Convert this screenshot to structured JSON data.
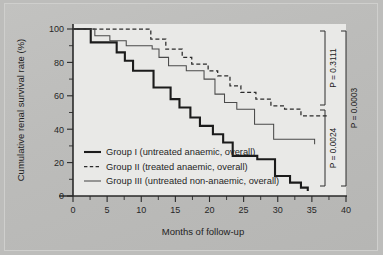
{
  "chart_data": {
    "type": "line",
    "subtype": "kaplan-meier-step",
    "title": "",
    "xlabel": "Months of follow-up",
    "ylabel": "Cumulative renal survival rate (%)",
    "xlim": [
      -2,
      40
    ],
    "ylim": [
      0,
      100
    ],
    "grid": false,
    "legend_position": "inside-lower-left",
    "x_ticks_major": [
      0,
      5,
      10,
      15,
      20,
      25,
      30,
      35,
      40
    ],
    "x_ticks_minor": [
      2.5,
      7.5,
      12.5,
      17.5,
      22.5,
      27.5,
      32.5,
      37.5
    ],
    "x_tick_labels": [
      "0",
      "5",
      "10",
      "15",
      "20",
      "25",
      "30",
      "35",
      "40"
    ],
    "y_ticks_major": [
      0,
      20,
      40,
      60,
      80,
      100
    ],
    "y_ticks_minor": [
      10,
      30,
      50,
      70,
      90
    ],
    "y_tick_labels": [
      "0",
      "20",
      "40",
      "60",
      "80",
      "100"
    ],
    "series": [
      {
        "name": "Group I (untreated anaemic, overall)",
        "style": "solid-thick",
        "color": "#1b1b1b",
        "points": [
          [
            0,
            100
          ],
          [
            2.6,
            100
          ],
          [
            2.6,
            92
          ],
          [
            6.4,
            92
          ],
          [
            6.4,
            86
          ],
          [
            7.6,
            86
          ],
          [
            7.6,
            81
          ],
          [
            8.8,
            81
          ],
          [
            8.8,
            75
          ],
          [
            11.8,
            75
          ],
          [
            11.8,
            65
          ],
          [
            14.3,
            65
          ],
          [
            14.3,
            58
          ],
          [
            15.6,
            58
          ],
          [
            15.6,
            53
          ],
          [
            17.2,
            53
          ],
          [
            17.2,
            47
          ],
          [
            18.6,
            47
          ],
          [
            18.6,
            42
          ],
          [
            20.5,
            42
          ],
          [
            20.5,
            37
          ],
          [
            22.0,
            37
          ],
          [
            22.0,
            32
          ],
          [
            23.4,
            32
          ],
          [
            23.4,
            24
          ],
          [
            27.0,
            24
          ],
          [
            27.0,
            22
          ],
          [
            29.6,
            22
          ],
          [
            29.6,
            12
          ],
          [
            31.8,
            12
          ],
          [
            31.8,
            8
          ],
          [
            33.4,
            8
          ],
          [
            33.4,
            5
          ],
          [
            34.4,
            5
          ],
          [
            34.4,
            3
          ]
        ]
      },
      {
        "name": "Group II (treated anaemic, overall)",
        "style": "dashed",
        "color": "#2b2b2b",
        "points": [
          [
            0,
            100
          ],
          [
            11.4,
            100
          ],
          [
            11.4,
            94
          ],
          [
            13.6,
            94
          ],
          [
            13.6,
            88
          ],
          [
            16.0,
            88
          ],
          [
            16.0,
            83
          ],
          [
            17.4,
            83
          ],
          [
            17.4,
            79
          ],
          [
            19.8,
            79
          ],
          [
            19.8,
            75
          ],
          [
            21.2,
            75
          ],
          [
            21.2,
            72
          ],
          [
            23.0,
            72
          ],
          [
            23.0,
            66
          ],
          [
            24.6,
            66
          ],
          [
            24.6,
            62
          ],
          [
            26.8,
            62
          ],
          [
            26.8,
            58
          ],
          [
            29.0,
            58
          ],
          [
            29.0,
            54
          ],
          [
            31.0,
            54
          ],
          [
            31.0,
            52
          ],
          [
            33.4,
            52
          ],
          [
            33.4,
            48
          ],
          [
            37.5,
            48
          ]
        ]
      },
      {
        "name": "Group III (untreated non-anaemic, overall)",
        "style": "solid-thin",
        "color": "#4a4a4a",
        "points": [
          [
            0,
            100
          ],
          [
            3.2,
            100
          ],
          [
            3.2,
            96
          ],
          [
            5.4,
            96
          ],
          [
            5.4,
            93
          ],
          [
            7.8,
            93
          ],
          [
            7.8,
            90
          ],
          [
            11.6,
            90
          ],
          [
            11.6,
            88
          ],
          [
            12.6,
            88
          ],
          [
            12.6,
            83
          ],
          [
            14.0,
            83
          ],
          [
            14.0,
            78
          ],
          [
            16.6,
            78
          ],
          [
            16.6,
            75
          ],
          [
            19.2,
            75
          ],
          [
            19.2,
            70
          ],
          [
            20.8,
            70
          ],
          [
            20.8,
            61
          ],
          [
            22.2,
            61
          ],
          [
            22.2,
            56
          ],
          [
            24.0,
            56
          ],
          [
            24.0,
            52
          ],
          [
            26.6,
            52
          ],
          [
            26.6,
            43
          ],
          [
            29.4,
            43
          ],
          [
            29.4,
            34
          ],
          [
            35.4,
            34
          ],
          [
            35.4,
            31
          ]
        ]
      }
    ],
    "annotations": [
      {
        "id": "p-upper",
        "label": "P = 0.3111",
        "compares": "Group II vs Group III"
      },
      {
        "id": "p-lower",
        "label": "P = 0.0024",
        "compares": "Group I vs Group III"
      },
      {
        "id": "p-outer",
        "label": "P = 0.0003",
        "compares": "Group I vs Group II"
      }
    ]
  },
  "legend": {
    "items": [
      {
        "label": "Group I (untreated anaemic, overall)",
        "style": "solid-thick"
      },
      {
        "label": "Group II (treated anaemic, overall)",
        "style": "dashed"
      },
      {
        "label": "Group III (untreated non-anaemic, overall)",
        "style": "solid-thin"
      }
    ]
  }
}
